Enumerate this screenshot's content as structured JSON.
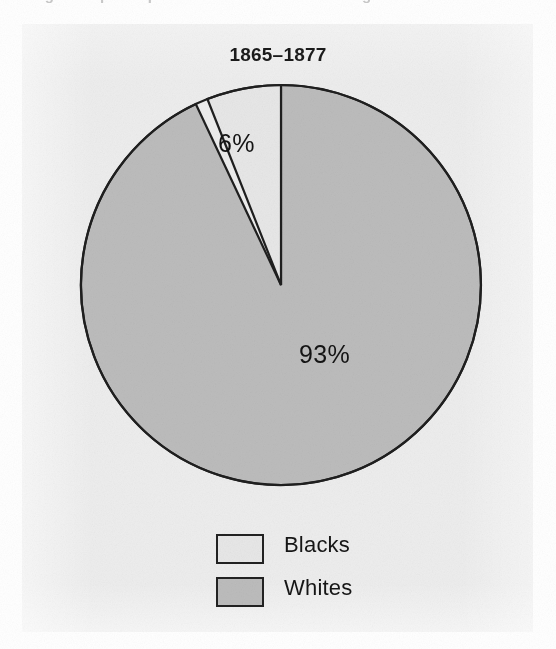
{
  "figure": {
    "top_crop_text": "age and participation in the reconstruction governments",
    "title": "1865–1877",
    "panel_bg": "#ededed"
  },
  "chart_data": {
    "type": "pie",
    "title": "1865–1877",
    "categories": [
      "Blacks",
      "Whites"
    ],
    "values": [
      6,
      93
    ],
    "labels": [
      "6%",
      "93%"
    ],
    "colors": [
      "#e7e7e7",
      "#bcbcbc"
    ],
    "unit": "percent",
    "start_angle_deg": 0,
    "direction": "counterclockwise",
    "legend_position": "bottom",
    "grid": false,
    "xlabel": "",
    "ylabel": ""
  },
  "slice_labels": {
    "blacks": "6%",
    "whites": "93%"
  },
  "legend": {
    "items": [
      {
        "label": "Blacks",
        "color": "#e7e7e7"
      },
      {
        "label": "Whites",
        "color": "#bcbcbc"
      }
    ]
  }
}
